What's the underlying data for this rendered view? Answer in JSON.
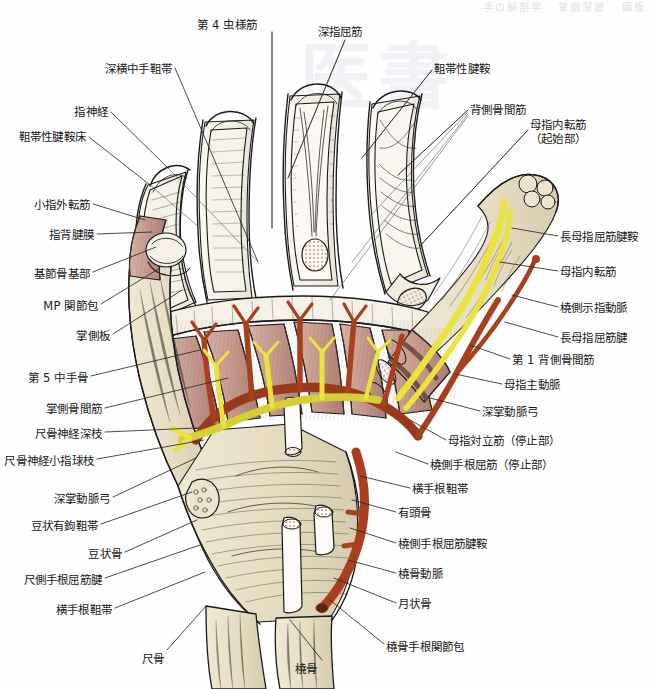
{
  "plate": {
    "running_head": "手の解剖学 · 掌側深層 · 図版",
    "watermark": "医書",
    "title": "",
    "palette": {
      "artery": "#a8401f",
      "nerve": "#e9e33c",
      "muscle": "#c79a8e",
      "bone": "#e8e0c8",
      "tendon": "#f2efe6",
      "outline": "#1a1a1a",
      "leader": "#2b2b2b",
      "background": "#ffffff",
      "cut_surface": "#b98b78"
    }
  },
  "labels_left": [
    {
      "id": "deep-transverse-metacarpal-ligament",
      "text": "深横中手靻帯",
      "x": 172,
      "y": 62,
      "anchor": "right",
      "leader": [
        [
          175,
          68
        ],
        [
          258,
          262
        ]
      ]
    },
    {
      "id": "digital-nerve",
      "text": "指神経",
      "x": 108,
      "y": 105,
      "anchor": "right",
      "leader": [
        [
          111,
          112
        ],
        [
          168,
          168
        ]
      ]
    },
    {
      "id": "ligamentous-tendon-sheath-bed",
      "text": "靻帯性腱鞍床",
      "x": 86,
      "y": 130,
      "anchor": "right",
      "leader": [
        [
          89,
          137
        ],
        [
          150,
          185
        ]
      ]
    },
    {
      "id": "abductor-digiti-minimi",
      "text": "小指外転筋",
      "x": 90,
      "y": 198,
      "anchor": "right",
      "leader": [
        [
          93,
          204
        ],
        [
          145,
          220
        ]
      ]
    },
    {
      "id": "dorsal-digital-expansion",
      "text": "指背腱膜",
      "x": 94,
      "y": 228,
      "anchor": "right",
      "leader": [
        [
          97,
          234
        ],
        [
          152,
          232
        ]
      ]
    },
    {
      "id": "base-of-proximal-phalanx",
      "text": "基節骨基部",
      "x": 90,
      "y": 267,
      "anchor": "right",
      "leader": [
        [
          93,
          272
        ],
        [
          156,
          247
        ]
      ]
    },
    {
      "id": "mp-joint-capsule",
      "text": "MP 関節包",
      "x": 98,
      "y": 299,
      "anchor": "right",
      "leader": [
        [
          101,
          304
        ],
        [
          160,
          268
        ]
      ]
    },
    {
      "id": "volar-plate",
      "text": "掌側板",
      "x": 110,
      "y": 329,
      "anchor": "right",
      "leader": [
        [
          113,
          334
        ],
        [
          182,
          290
        ]
      ]
    },
    {
      "id": "fifth-metacarpal",
      "text": "第 5 中手骨",
      "x": 88,
      "y": 371,
      "anchor": "right",
      "leader": [
        [
          91,
          376
        ],
        [
          200,
          350
        ]
      ]
    },
    {
      "id": "palmar-interossei",
      "text": "掌側骨間筋",
      "x": 102,
      "y": 402,
      "anchor": "right",
      "leader": [
        [
          105,
          408
        ],
        [
          228,
          378
        ]
      ]
    },
    {
      "id": "ulnar-nerve-deep-branch",
      "text": "尺骨神経深枝",
      "x": 102,
      "y": 427,
      "anchor": "right",
      "leader": [
        [
          105,
          432
        ],
        [
          196,
          428
        ]
      ]
    },
    {
      "id": "ulnar-nerve-hypothenar-branch",
      "text": "尺骨神経小指球枝",
      "x": 94,
      "y": 454,
      "anchor": "right",
      "leader": [
        [
          97,
          459
        ],
        [
          204,
          440
        ]
      ]
    },
    {
      "id": "deep-palmar-arch",
      "text": "深掌動脈弓",
      "x": 110,
      "y": 492,
      "anchor": "right",
      "leader": [
        [
          113,
          497
        ],
        [
          196,
          458
        ]
      ]
    },
    {
      "id": "pisohamate-ligament",
      "text": "豆状有鉤靻帯",
      "x": 98,
      "y": 519,
      "anchor": "right",
      "leader": [
        [
          101,
          524
        ],
        [
          192,
          492
        ]
      ]
    },
    {
      "id": "pisiform",
      "text": "豆状骨",
      "x": 122,
      "y": 547,
      "anchor": "right",
      "leader": [
        [
          125,
          552
        ],
        [
          197,
          520
        ]
      ]
    },
    {
      "id": "flexor-carpi-ulnaris-tendon",
      "text": "尺側手根屈筋腱",
      "x": 102,
      "y": 573,
      "anchor": "right",
      "leader": [
        [
          105,
          578
        ],
        [
          200,
          545
        ]
      ]
    },
    {
      "id": "transverse-carpal-ligament-left",
      "text": "横手根靻帯",
      "x": 112,
      "y": 603,
      "anchor": "right",
      "leader": [
        [
          115,
          608
        ],
        [
          205,
          572
        ]
      ]
    },
    {
      "id": "ulna",
      "text": "尺骨",
      "x": 164,
      "y": 652,
      "anchor": "right",
      "leader": [
        [
          167,
          650
        ],
        [
          206,
          606
        ]
      ]
    }
  ],
  "labels_top": [
    {
      "id": "fourth-lumbrical",
      "text": "第 4 虫様筋",
      "x": 227,
      "y": 18,
      "anchor": "center",
      "leader": [
        [
          272,
          32
        ],
        [
          272,
          228
        ]
      ]
    },
    {
      "id": "flexor-digitorum-profundus",
      "text": "深指屈筋",
      "x": 340,
      "y": 25,
      "anchor": "center",
      "leader": [
        [
          345,
          40
        ],
        [
          288,
          178
        ]
      ]
    }
  ],
  "labels_right": [
    {
      "id": "ligamentous-tendon-sheath",
      "text": "靻帯性腱鞍",
      "x": 434,
      "y": 62,
      "anchor": "left",
      "leader": [
        [
          432,
          70
        ],
        [
          362,
          158
        ]
      ]
    },
    {
      "id": "dorsal-interossei",
      "text": "背側骨間筋",
      "x": 470,
      "y": 103,
      "anchor": "left",
      "leader": [
        [
          468,
          110
        ],
        [
          398,
          175
        ]
      ]
    },
    {
      "id": "adductor-pollicis-origin",
      "text": "母指内転筋\n（起始部）",
      "x": 530,
      "y": 118,
      "anchor": "left",
      "leader": [
        [
          528,
          130
        ],
        [
          420,
          246
        ]
      ]
    },
    {
      "id": "flexor-pollicis-longus-sheath",
      "text": "長母指屈筋腱鞍",
      "x": 560,
      "y": 230,
      "anchor": "left",
      "leader": [
        [
          558,
          236
        ],
        [
          512,
          228
        ]
      ]
    },
    {
      "id": "adductor-pollicis",
      "text": "母指内転筋",
      "x": 560,
      "y": 265,
      "anchor": "left",
      "leader": [
        [
          558,
          271
        ],
        [
          500,
          262
        ]
      ]
    },
    {
      "id": "radialis-indicis-artery",
      "text": "橈側示指動脈",
      "x": 560,
      "y": 301,
      "anchor": "left",
      "leader": [
        [
          558,
          307
        ],
        [
          512,
          295
        ]
      ]
    },
    {
      "id": "flexor-pollicis-longus-tendon",
      "text": "長母指屈筋腱",
      "x": 560,
      "y": 331,
      "anchor": "left",
      "leader": [
        [
          558,
          337
        ],
        [
          505,
          322
        ]
      ]
    },
    {
      "id": "first-dorsal-interosseous",
      "text": "第 1 背側骨間筋",
      "x": 512,
      "y": 353,
      "anchor": "left",
      "leader": [
        [
          510,
          359
        ],
        [
          470,
          345
        ]
      ]
    },
    {
      "id": "princeps-pollicis-artery",
      "text": "母指主動脈",
      "x": 504,
      "y": 378,
      "anchor": "left",
      "leader": [
        [
          502,
          384
        ],
        [
          455,
          374
        ]
      ]
    },
    {
      "id": "deep-palmar-arch-right",
      "text": "深掌動脈弓",
      "x": 482,
      "y": 405,
      "anchor": "left",
      "leader": [
        [
          480,
          411
        ],
        [
          430,
          398
        ]
      ]
    },
    {
      "id": "opponens-pollicis-insertion",
      "text": "母指対立筋（停止部）",
      "x": 448,
      "y": 434,
      "anchor": "left",
      "leader": [
        [
          446,
          440
        ],
        [
          410,
          420
        ]
      ]
    },
    {
      "id": "flexor-carpi-radialis-insertion",
      "text": "橈側手根屈筋（停止部）",
      "x": 430,
      "y": 458,
      "anchor": "left",
      "leader": [
        [
          428,
          464
        ],
        [
          396,
          452
        ]
      ]
    },
    {
      "id": "transverse-carpal-ligament-right",
      "text": "横手根靻帯",
      "x": 412,
      "y": 482,
      "anchor": "left",
      "leader": [
        [
          410,
          488
        ],
        [
          360,
          476
        ]
      ]
    },
    {
      "id": "capitate",
      "text": "有頭骨",
      "x": 398,
      "y": 506,
      "anchor": "left",
      "leader": [
        [
          396,
          512
        ],
        [
          352,
          500
        ]
      ]
    },
    {
      "id": "flexor-carpi-radialis-sheath",
      "text": "橈側手根屈筋腱鞍",
      "x": 398,
      "y": 537,
      "anchor": "left",
      "leader": [
        [
          396,
          543
        ],
        [
          350,
          528
        ]
      ]
    },
    {
      "id": "radial-artery",
      "text": "橈骨動脈",
      "x": 398,
      "y": 567,
      "anchor": "left",
      "leader": [
        [
          396,
          573
        ],
        [
          348,
          560
        ]
      ]
    },
    {
      "id": "lunate",
      "text": "月状骨",
      "x": 398,
      "y": 597,
      "anchor": "left",
      "leader": [
        [
          396,
          603
        ],
        [
          334,
          578
        ]
      ]
    },
    {
      "id": "radiocarpal-joint-capsule",
      "text": "橈骨手根関節包",
      "x": 386,
      "y": 640,
      "anchor": "left",
      "leader": [
        [
          384,
          644
        ],
        [
          330,
          600
        ]
      ]
    }
  ],
  "labels_bottom": [
    {
      "id": "radius",
      "text": "橈骨",
      "x": 306,
      "y": 662,
      "anchor": "center",
      "leader": [
        [
          322,
          660
        ],
        [
          290,
          620
        ]
      ]
    }
  ],
  "structures": {
    "fingers": [
      "index",
      "middle",
      "ring",
      "little"
    ],
    "thumb": "pollex",
    "view": "palmar-deep-dissection"
  }
}
